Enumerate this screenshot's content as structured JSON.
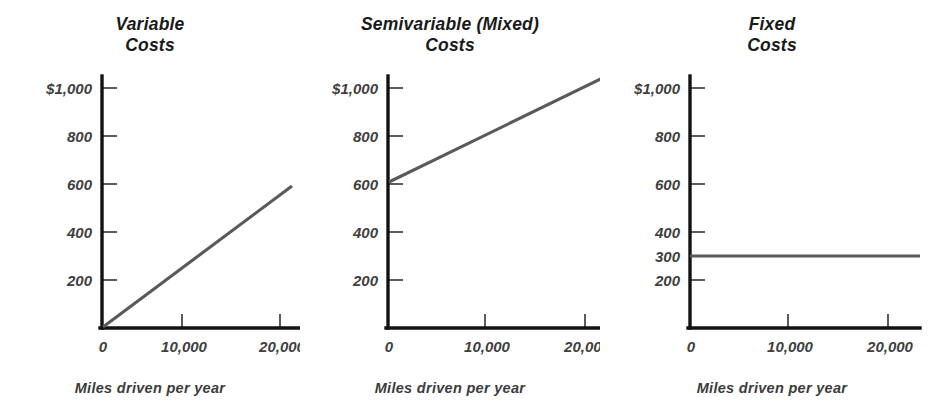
{
  "figure": {
    "background_color": "#ffffff",
    "axis_color": "#121212",
    "line_color": "#5a5a5a",
    "text_color": "#3f3f3f"
  },
  "panels": [
    {
      "id": "variable-costs",
      "title": "Variable\nCosts",
      "xlabel": "Miles driven per year",
      "ytick_labels": [
        "$1,000",
        "800",
        "600",
        "400",
        "200"
      ],
      "xtick_labels": [
        "0",
        "10,000",
        "20,000"
      ]
    },
    {
      "id": "semivariable-mixed-costs",
      "title": "Semivariable (Mixed)\nCosts",
      "xlabel": "Miles driven per year",
      "ytick_labels": [
        "$1,000",
        "800",
        "600",
        "400",
        "200"
      ],
      "xtick_labels": [
        "0",
        "10,000",
        "20,000"
      ]
    },
    {
      "id": "fixed-costs",
      "title": "Fixed\nCosts",
      "xlabel": "Miles driven per year",
      "ytick_labels": [
        "$1,000",
        "800",
        "600",
        "400",
        "300",
        "200"
      ],
      "xtick_labels": [
        "0",
        "10,000",
        "20,000"
      ]
    }
  ],
  "chart_data": [
    {
      "type": "line",
      "title": "Variable Costs",
      "xlabel": "Miles driven per year",
      "ylabel": "",
      "xlim": [
        0,
        23500
      ],
      "ylim": [
        0,
        1100
      ],
      "xticks": [
        0,
        10000,
        20000
      ],
      "xtick_labels": [
        "0",
        "10,000",
        "20,000"
      ],
      "yticks": [
        200,
        400,
        600,
        800,
        1000
      ],
      "ytick_labels": [
        "200",
        "400",
        "600",
        "800",
        "$1,000"
      ],
      "grid": false,
      "legend": false,
      "series": [
        {
          "name": "Variable cost",
          "x": [
            0,
            19500
          ],
          "y": [
            0,
            590
          ],
          "description": "Straight line rising from the origin; cost is strictly proportional to miles driven (about $0.030 per mile)."
        }
      ]
    },
    {
      "type": "line",
      "title": "Semivariable (Mixed) Costs",
      "xlabel": "Miles driven per year",
      "ylabel": "",
      "xlim": [
        0,
        23500
      ],
      "ylim": [
        0,
        1100
      ],
      "xticks": [
        0,
        10000,
        20000
      ],
      "xtick_labels": [
        "0",
        "10,000",
        "20,000"
      ],
      "yticks": [
        200,
        400,
        600,
        800,
        1000
      ],
      "ytick_labels": [
        "200",
        "400",
        "600",
        "800",
        "$1,000"
      ],
      "grid": false,
      "legend": false,
      "series": [
        {
          "name": "Semivariable (mixed) cost",
          "x": [
            0,
            22500
          ],
          "y": [
            610,
            1060
          ],
          "description": "Straight line starting at about $610 at zero miles and rising to roughly $1,060; a fixed component plus a variable component of about $0.020 per mile."
        }
      ]
    },
    {
      "type": "line",
      "title": "Fixed Costs",
      "xlabel": "Miles driven per year",
      "ylabel": "",
      "xlim": [
        0,
        23500
      ],
      "ylim": [
        0,
        1100
      ],
      "xticks": [
        0,
        10000,
        20000
      ],
      "xtick_labels": [
        "0",
        "10,000",
        "20,000"
      ],
      "yticks": [
        200,
        300,
        400,
        600,
        800,
        1000
      ],
      "ytick_labels": [
        "200",
        "300",
        "400",
        "600",
        "800",
        "$1,000"
      ],
      "grid": false,
      "legend": false,
      "series": [
        {
          "name": "Fixed cost",
          "x": [
            0,
            23000
          ],
          "y": [
            300,
            300
          ],
          "description": "Horizontal line held constant at $300 regardless of miles driven."
        }
      ]
    }
  ]
}
